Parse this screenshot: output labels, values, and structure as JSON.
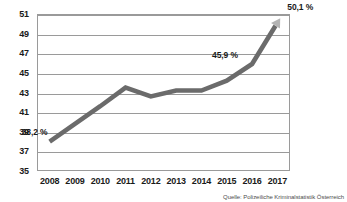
{
  "chart_data": {
    "type": "line",
    "title": "",
    "subtitle": "",
    "xlabel": "",
    "ylabel": "",
    "categories": [
      "2008",
      "2009",
      "2010",
      "2011",
      "2012",
      "2013",
      "2014",
      "2015",
      "2016",
      "2017"
    ],
    "values": [
      38.0,
      39.8,
      41.6,
      43.5,
      42.6,
      43.2,
      43.2,
      44.2,
      45.9,
      50.1
    ],
    "series": [
      {
        "name": "Anteil",
        "values": [
          38.0,
          39.8,
          41.6,
          43.5,
          42.6,
          43.2,
          43.2,
          44.2,
          45.9,
          50.1
        ]
      }
    ],
    "ylim": [
      35,
      51
    ],
    "ytick_step": 2,
    "yticks": [
      35,
      37,
      39,
      41,
      43,
      45,
      47,
      49,
      51
    ],
    "grid": true,
    "legend": "none",
    "line_color": "#6b6b6b",
    "arrow_color": "#b3b3b3",
    "grid_color": "#9a9a9a",
    "annotations": [
      {
        "id": "label-2008",
        "text": "38,2 %",
        "category": "2008",
        "value": 38.2
      },
      {
        "id": "label-2016",
        "text": "45,9 %",
        "category": "2016",
        "value": 45.9
      },
      {
        "id": "label-2017",
        "text": "50,1 %",
        "category": "2017",
        "value": 50.1
      }
    ]
  },
  "source": {
    "text": "Quelle: Polizeiliche Kriminalstatistik Österreich"
  }
}
